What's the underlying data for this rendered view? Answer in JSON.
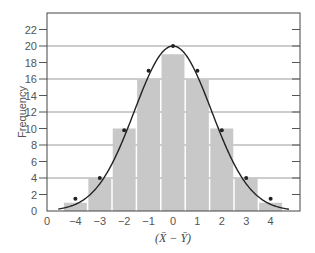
{
  "chart_data": {
    "type": "bar",
    "title": "",
    "xlabel": "(X̄ − Ȳ)",
    "ylabel": "Frequency",
    "categories": [
      "-4",
      "-3",
      "-2",
      "-1",
      "0",
      "1",
      "2",
      "3",
      "4"
    ],
    "x": [
      -4,
      -3,
      -2,
      -1,
      0,
      1,
      2,
      3,
      4
    ],
    "series": [
      {
        "name": "histogram",
        "type": "bar",
        "values": [
          1,
          4,
          10,
          16,
          19,
          16,
          10,
          4,
          1
        ],
        "color": "#c8c8c8"
      },
      {
        "name": "normal curve points",
        "type": "line",
        "values": [
          1.5,
          4,
          9.8,
          17,
          20,
          17,
          9.8,
          4,
          1.5
        ],
        "color": "#222222"
      }
    ],
    "x_ticks": [
      "0",
      "−4",
      "−3",
      "−2",
      "−1",
      "0",
      "1",
      "2",
      "3",
      "4"
    ],
    "y_ticks": [
      0,
      2,
      4,
      6,
      8,
      10,
      12,
      14,
      16,
      18,
      20,
      22
    ],
    "gridlines_y": [
      4,
      8,
      12,
      16,
      20
    ],
    "ylim": [
      0,
      23.5
    ],
    "xlim": [
      -5.15,
      5.3
    ],
    "grid": true,
    "legend": null
  },
  "axes": {
    "ylabel": "Frequency",
    "xlabel": "(X̄ − Ȳ)",
    "origin_label": "0"
  }
}
